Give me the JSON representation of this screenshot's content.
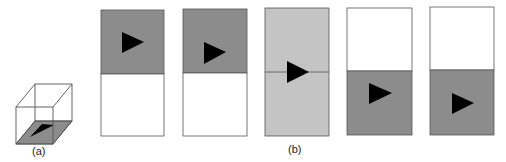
{
  "figure": {
    "labels": {
      "a": "(a)",
      "b": "(b)"
    },
    "colors": {
      "dark_gray": "#8c8c8c",
      "light_gray": "#c4c4c4",
      "white": "#ffffff",
      "stroke": "#555555",
      "triangle": "#000000"
    },
    "cube": {
      "description": "wireframe cube with shaded gray bottom face containing a black triangle"
    },
    "panels": [
      {
        "index": 1,
        "top_fill": "dark_gray",
        "bottom_fill": "white",
        "triangle_position": "upper-middle"
      },
      {
        "index": 2,
        "top_fill": "dark_gray",
        "bottom_fill": "white",
        "triangle_position": "upper-lower"
      },
      {
        "index": 3,
        "top_fill": "light_gray",
        "bottom_fill": "light_gray",
        "triangle_position": "on-divider"
      },
      {
        "index": 4,
        "top_fill": "white",
        "bottom_fill": "dark_gray",
        "triangle_position": "lower-upper"
      },
      {
        "index": 5,
        "top_fill": "white",
        "bottom_fill": "dark_gray",
        "triangle_position": "lower-middle"
      }
    ]
  }
}
